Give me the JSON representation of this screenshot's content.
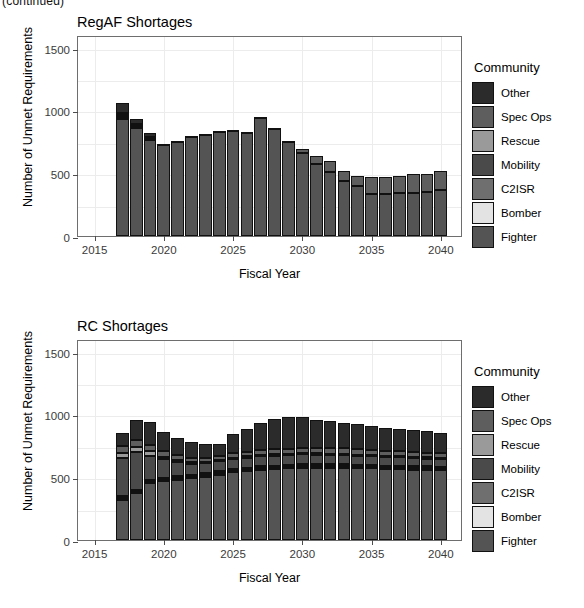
{
  "clipped_header": "(continued)",
  "legend": {
    "title": "Community",
    "entries": [
      {
        "label": "Other",
        "color": "#2b2b2b"
      },
      {
        "label": "Spec Ops",
        "color": "#5e5e5e"
      },
      {
        "label": "Rescue",
        "color": "#9a9a9a"
      },
      {
        "label": "Mobility",
        "color": "#4a4a4a"
      },
      {
        "label": "C2ISR",
        "color": "#6f6f6f"
      },
      {
        "label": "Bomber",
        "color": "#e3e3e3"
      },
      {
        "label": "Fighter",
        "color": "#545454"
      }
    ]
  },
  "axis": {
    "xlabel": "Fiscal Year",
    "ylabel": "Number of Unmet Requirements",
    "yticks": [
      0,
      500,
      1000,
      1500
    ],
    "ytick_labels": [
      "0",
      "500",
      "1000",
      "1500"
    ],
    "xticks": [
      2015,
      2020,
      2025,
      2030,
      2035,
      2040
    ],
    "xtick_labels": [
      "2015",
      "2020",
      "2025",
      "2030",
      "2035",
      "2040"
    ],
    "ylim": [
      0,
      1600
    ],
    "xlim": [
      2013.8,
      2041.6
    ]
  },
  "chart_data": [
    {
      "type": "bar",
      "stacked": true,
      "title": "RegAF Shortages",
      "xlabel": "Fiscal Year",
      "ylabel": "Number of Unmet Requirements",
      "ylim": [
        0,
        1600
      ],
      "xlim": [
        2013.8,
        2041.6
      ],
      "grid": true,
      "legend_position": "right",
      "legend_title": "Community",
      "categories": [
        2017,
        2018,
        2019,
        2020,
        2021,
        2022,
        2023,
        2024,
        2025,
        2026,
        2027,
        2028,
        2029,
        2030,
        2031,
        2032,
        2033,
        2034,
        2035,
        2036,
        2037,
        2038,
        2039,
        2040
      ],
      "series": [
        {
          "name": "Fighter",
          "color": "#545454",
          "values": [
            930,
            860,
            770,
            725,
            755,
            795,
            805,
            830,
            835,
            825,
            940,
            855,
            750,
            660,
            570,
            510,
            440,
            395,
            335,
            335,
            340,
            345,
            350,
            370
          ]
        },
        {
          "name": "Bomber",
          "color": "#e3e3e3",
          "values": [
            14,
            6,
            4,
            0,
            0,
            0,
            0,
            0,
            0,
            0,
            0,
            0,
            0,
            0,
            0,
            0,
            0,
            0,
            0,
            0,
            0,
            0,
            0,
            0
          ]
        },
        {
          "name": "C2ISR",
          "color": "#6f6f6f",
          "values": [
            6,
            4,
            2,
            0,
            0,
            0,
            0,
            0,
            0,
            0,
            0,
            0,
            0,
            0,
            0,
            0,
            0,
            0,
            0,
            0,
            0,
            0,
            0,
            0
          ]
        },
        {
          "name": "Mobility",
          "color": "#4a4a4a",
          "values": [
            8,
            4,
            2,
            0,
            0,
            0,
            0,
            0,
            0,
            0,
            0,
            0,
            0,
            0,
            0,
            0,
            0,
            0,
            0,
            0,
            0,
            0,
            0,
            0
          ]
        },
        {
          "name": "Rescue",
          "color": "#9a9a9a",
          "values": [
            4,
            2,
            0,
            0,
            0,
            0,
            0,
            0,
            0,
            0,
            0,
            0,
            0,
            0,
            0,
            0,
            0,
            0,
            0,
            0,
            0,
            0,
            0,
            0
          ]
        },
        {
          "name": "Spec Ops",
          "color": "#5e5e5e",
          "values": [
            16,
            12,
            10,
            5,
            5,
            5,
            5,
            5,
            5,
            5,
            5,
            5,
            10,
            30,
            70,
            85,
            80,
            85,
            135,
            135,
            140,
            145,
            145,
            145
          ]
        },
        {
          "name": "Other",
          "color": "#2b2b2b",
          "values": [
            82,
            42,
            32,
            0,
            0,
            0,
            0,
            0,
            0,
            0,
            0,
            0,
            0,
            0,
            0,
            0,
            0,
            0,
            0,
            0,
            0,
            0,
            0,
            0
          ]
        }
      ],
      "totals": [
        1060,
        930,
        820,
        730,
        760,
        800,
        810,
        835,
        840,
        830,
        945,
        860,
        760,
        690,
        640,
        595,
        520,
        480,
        470,
        470,
        480,
        490,
        495,
        515
      ]
    },
    {
      "type": "bar",
      "stacked": true,
      "title": "RC Shortages",
      "xlabel": "Fiscal Year",
      "ylabel": "Number of Unmet Requirements",
      "ylim": [
        0,
        1600
      ],
      "xlim": [
        2013.8,
        2041.6
      ],
      "grid": true,
      "legend_position": "right",
      "legend_title": "Community",
      "categories": [
        2017,
        2018,
        2019,
        2020,
        2021,
        2022,
        2023,
        2024,
        2025,
        2026,
        2027,
        2028,
        2029,
        2030,
        2031,
        2032,
        2033,
        2034,
        2035,
        2036,
        2037,
        2038,
        2039,
        2040
      ],
      "series": [
        {
          "name": "Fighter",
          "color": "#545454",
          "values": [
            320,
            375,
            450,
            470,
            480,
            490,
            505,
            520,
            540,
            550,
            560,
            565,
            570,
            575,
            575,
            575,
            575,
            570,
            570,
            565,
            565,
            560,
            560,
            555
          ]
        },
        {
          "name": "Bomber",
          "color": "#e3e3e3",
          "values": [
            14,
            12,
            12,
            12,
            12,
            12,
            12,
            12,
            12,
            12,
            12,
            12,
            12,
            12,
            12,
            12,
            12,
            12,
            12,
            12,
            12,
            12,
            12,
            12
          ]
        },
        {
          "name": "C2ISR",
          "color": "#6f6f6f",
          "values": [
            16,
            14,
            14,
            14,
            14,
            14,
            14,
            14,
            14,
            14,
            14,
            14,
            14,
            14,
            14,
            14,
            14,
            14,
            14,
            14,
            14,
            14,
            14,
            14
          ]
        },
        {
          "name": "Mobility",
          "color": "#4a4a4a",
          "values": [
            300,
            300,
            195,
            145,
            115,
            90,
            80,
            80,
            80,
            80,
            80,
            80,
            80,
            80,
            78,
            76,
            74,
            72,
            70,
            68,
            66,
            64,
            62,
            60
          ]
        },
        {
          "name": "Rescue",
          "color": "#9a9a9a",
          "values": [
            40,
            40,
            36,
            22,
            16,
            12,
            10,
            10,
            10,
            10,
            10,
            10,
            10,
            10,
            10,
            10,
            10,
            10,
            10,
            10,
            10,
            10,
            10,
            10
          ]
        },
        {
          "name": "Spec Ops",
          "color": "#5e5e5e",
          "values": [
            60,
            58,
            52,
            46,
            40,
            36,
            32,
            32,
            34,
            36,
            38,
            40,
            42,
            44,
            44,
            44,
            44,
            44,
            42,
            42,
            40,
            40,
            38,
            38
          ]
        },
        {
          "name": "Other",
          "color": "#2b2b2b",
          "values": [
            105,
            155,
            180,
            150,
            138,
            126,
            112,
            98,
            150,
            185,
            215,
            240,
            250,
            245,
            225,
            215,
            205,
            198,
            190,
            182,
            178,
            172,
            168,
            166
          ]
        }
      ],
      "totals": [
        855,
        954,
        939,
        859,
        815,
        780,
        765,
        766,
        840,
        887,
        929,
        961,
        978,
        980,
        958,
        946,
        934,
        920,
        908,
        893,
        885,
        872,
        864,
        855
      ]
    }
  ]
}
